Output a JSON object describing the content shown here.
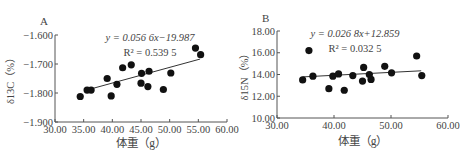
{
  "chart_data": [
    {
      "type": "scatter",
      "panel_label": "A",
      "title": "",
      "xlabel": "体重（g）",
      "ylabel": "δ13C（%）",
      "xlim": [
        30,
        60
      ],
      "ylim": [
        -1.9,
        -1.6
      ],
      "x_ticks": [
        "30.00",
        "35.00",
        "40.00",
        "45.00",
        "50.00",
        "55.00",
        "60.00"
      ],
      "y_ticks": [
        "-1.600",
        "-1.700",
        "-1.800",
        "-1.900"
      ],
      "equation": "y = 0.056 6x−19.987",
      "r_squared": "R² = 0.539 5",
      "trendline": {
        "slope": 0.0566,
        "intercept": -19.987,
        "x_range": [
          35.5,
          55.3
        ],
        "y_range": [
          -1.79,
          -1.683
        ]
      },
      "grid": false,
      "points": [
        {
          "x": 34.4,
          "y": -1.812
        },
        {
          "x": 35.6,
          "y": -1.79
        },
        {
          "x": 36.3,
          "y": -1.79
        },
        {
          "x": 39.1,
          "y": -1.75
        },
        {
          "x": 39.8,
          "y": -1.81
        },
        {
          "x": 40.8,
          "y": -1.77
        },
        {
          "x": 41.8,
          "y": -1.713
        },
        {
          "x": 43.3,
          "y": -1.703
        },
        {
          "x": 45.0,
          "y": -1.766
        },
        {
          "x": 45.1,
          "y": -1.732
        },
        {
          "x": 46.2,
          "y": -1.778
        },
        {
          "x": 46.4,
          "y": -1.725
        },
        {
          "x": 48.9,
          "y": -1.788
        },
        {
          "x": 50.2,
          "y": -1.731
        },
        {
          "x": 54.5,
          "y": -1.645
        },
        {
          "x": 55.4,
          "y": -1.668
        }
      ]
    },
    {
      "type": "scatter",
      "panel_label": "B",
      "title": "",
      "xlabel": "体重（g）",
      "ylabel": "δ15N（%）",
      "xlim": [
        30,
        60
      ],
      "ylim": [
        10,
        18
      ],
      "x_ticks": [
        "30.00",
        "40.00",
        "50.00",
        "60.00"
      ],
      "y_ticks": [
        "18.00",
        "16.00",
        "14.00",
        "12.00",
        "10.00"
      ],
      "equation": "y = 0.026 8x+12.859",
      "r_squared": "R² = 0.032 5",
      "trendline": {
        "slope": 0.0268,
        "intercept": 12.859,
        "x_range": [
          34.5,
          55.3
        ],
        "y_range": [
          13.78,
          14.34
        ]
      },
      "grid": false,
      "points": [
        {
          "x": 34.5,
          "y": 13.5
        },
        {
          "x": 35.6,
          "y": 16.2
        },
        {
          "x": 36.3,
          "y": 13.85
        },
        {
          "x": 39.1,
          "y": 12.7
        },
        {
          "x": 39.8,
          "y": 13.85
        },
        {
          "x": 40.8,
          "y": 14.05
        },
        {
          "x": 41.8,
          "y": 12.55
        },
        {
          "x": 43.3,
          "y": 13.9
        },
        {
          "x": 45.0,
          "y": 13.4
        },
        {
          "x": 45.2,
          "y": 14.65
        },
        {
          "x": 46.2,
          "y": 14.0
        },
        {
          "x": 46.5,
          "y": 13.55
        },
        {
          "x": 48.9,
          "y": 14.75
        },
        {
          "x": 50.1,
          "y": 14.15
        },
        {
          "x": 54.5,
          "y": 15.7
        },
        {
          "x": 55.4,
          "y": 13.9
        }
      ]
    }
  ]
}
